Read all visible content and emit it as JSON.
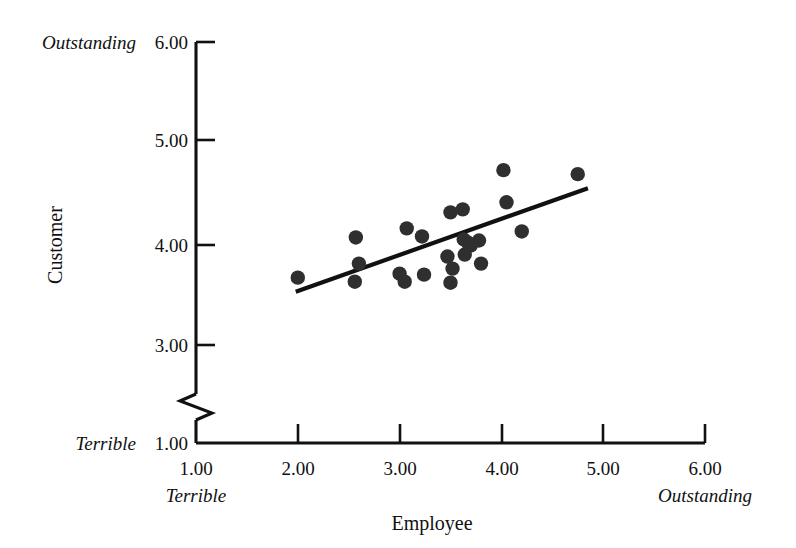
{
  "chart_data": {
    "type": "scatter",
    "title": "",
    "xlabel": "Employee",
    "ylabel": "Customer",
    "xlim": [
      1.0,
      6.0
    ],
    "ylim": [
      1.0,
      6.0
    ],
    "grid": false,
    "legend": null,
    "x_ticks": [
      "1.00",
      "2.00",
      "3.00",
      "4.00",
      "5.00",
      "6.00"
    ],
    "x_tick_values": [
      1.0,
      2.0,
      3.0,
      4.0,
      5.0,
      6.0
    ],
    "y_ticks": [
      "1.00",
      "3.00",
      "4.00",
      "5.00",
      "6.00"
    ],
    "y_tick_values": [
      1.0,
      3.0,
      4.0,
      5.0,
      6.0
    ],
    "y_axis_break": {
      "between": [
        1.0,
        3.0
      ],
      "style": "zigzag"
    },
    "x_axis_anchor_low": "Terrible",
    "x_axis_anchor_high": "Outstanding",
    "y_axis_anchor_low": "Terrible",
    "y_axis_anchor_high": "Outstanding",
    "point_color": "#2f2f2f",
    "line_color": "#111111",
    "points": [
      {
        "x": 2.0,
        "y": 3.67
      },
      {
        "x": 2.57,
        "y": 4.07
      },
      {
        "x": 2.6,
        "y": 3.81
      },
      {
        "x": 2.56,
        "y": 3.63
      },
      {
        "x": 3.07,
        "y": 4.16
      },
      {
        "x": 3.0,
        "y": 3.71
      },
      {
        "x": 3.05,
        "y": 3.63
      },
      {
        "x": 3.22,
        "y": 4.08
      },
      {
        "x": 3.24,
        "y": 3.7
      },
      {
        "x": 3.5,
        "y": 4.32
      },
      {
        "x": 3.47,
        "y": 3.88
      },
      {
        "x": 3.52,
        "y": 3.76
      },
      {
        "x": 3.5,
        "y": 3.62
      },
      {
        "x": 3.62,
        "y": 4.35
      },
      {
        "x": 3.63,
        "y": 4.05
      },
      {
        "x": 3.67,
        "y": 4.02
      },
      {
        "x": 3.7,
        "y": 3.99
      },
      {
        "x": 3.64,
        "y": 3.9
      },
      {
        "x": 3.78,
        "y": 4.04
      },
      {
        "x": 3.8,
        "y": 3.81
      },
      {
        "x": 4.05,
        "y": 4.42
      },
      {
        "x": 4.02,
        "y": 4.74
      },
      {
        "x": 4.2,
        "y": 4.13
      },
      {
        "x": 4.75,
        "y": 4.7
      }
    ],
    "trendline": {
      "x_start": 1.98,
      "y_start": 3.53,
      "x_end": 4.85,
      "y_end": 4.56
    }
  }
}
